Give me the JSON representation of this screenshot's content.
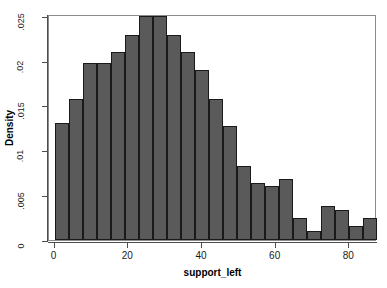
{
  "chart_data": {
    "type": "bar",
    "title": "",
    "subtitle": "",
    "xlabel": "support_left",
    "ylabel": "Density",
    "xlim": [
      -1.5,
      87.5
    ],
    "ylim": [
      0,
      0.0252
    ],
    "grid": false,
    "legend": null,
    "xticks": [
      0,
      20,
      40,
      60,
      80
    ],
    "xtick_labels": [
      "0",
      "20",
      "40",
      "60",
      "80"
    ],
    "yticks": [
      0,
      0.005,
      0.01,
      0.015,
      0.02,
      0.025
    ],
    "ytick_labels": [
      "0",
      ".005",
      ".01",
      ".015",
      ".02",
      ".025"
    ],
    "bar_color": "#5a5a5a",
    "bar_edge_color": "#1a1a1a",
    "bin_edges": [
      0,
      3.8,
      7.6,
      11.4,
      15.2,
      19.0,
      22.8,
      26.6,
      30.4,
      34.2,
      38.0,
      41.8,
      45.6,
      49.4,
      53.2,
      57.0,
      60.8,
      64.6,
      68.4,
      72.2,
      76.0,
      79.8,
      83.6,
      87.4
    ],
    "categories": [
      "0-3.8",
      "3.8-7.6",
      "7.6-11.4",
      "11.4-15.2",
      "15.2-19.0",
      "19.0-22.8",
      "22.8-26.6",
      "26.6-30.4",
      "30.4-34.2",
      "34.2-38.0",
      "38.0-41.8",
      "41.8-45.6",
      "45.6-49.4",
      "49.4-53.2",
      "53.2-57.0",
      "57.0-60.8",
      "60.8-64.6",
      "64.6-68.4",
      "68.4-72.2",
      "72.2-76.0",
      "76.0-79.8",
      "79.8-83.6",
      "83.6-87.4"
    ],
    "values": [
      0.013,
      0.0157,
      0.0197,
      0.0197,
      0.021,
      0.0229,
      0.025,
      0.025,
      0.0229,
      0.021,
      0.019,
      0.0157,
      0.0127,
      0.0082,
      0.0064,
      0.006,
      0.0068,
      0.0025,
      0.001,
      0.0038,
      0.0034,
      0.0016,
      0.0025
    ]
  },
  "axes": {
    "y_title": "Density",
    "x_title": "support_left"
  }
}
